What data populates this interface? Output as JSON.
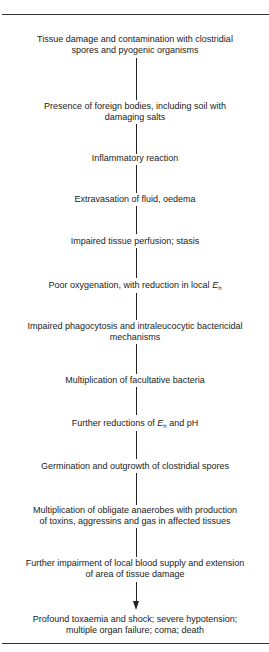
{
  "flowchart": {
    "steps": [
      {
        "lines": [
          "Tissue damage and contamination with clostridial",
          "spores and pyogenic organisms"
        ]
      },
      {
        "lines": [
          "Presence of foreign bodies, including soil with",
          "damaging salts"
        ]
      },
      {
        "lines": [
          "Inflammatory reaction"
        ]
      },
      {
        "lines": [
          "Extravasation of fluid, oedema"
        ]
      },
      {
        "lines": [
          "Impaired tissue perfusion; stasis"
        ]
      },
      {
        "text_before": "Poor oxygenation, with reduction in local ",
        "symbol": "E",
        "subscript": "h",
        "text_after": ""
      },
      {
        "lines": [
          "Impaired phagocytosis and intraleucocytic bactericidal",
          "mechanisms"
        ]
      },
      {
        "lines": [
          "Multiplication of facultative bacteria"
        ]
      },
      {
        "text_before": "Further reductions of ",
        "symbol": "E",
        "subscript": "h",
        "text_after": " and pH"
      },
      {
        "lines": [
          "Germination and outgrowth of clostridial spores"
        ]
      },
      {
        "lines": [
          "Multiplication of obligate anaerobes with production",
          "of toxins, aggressins and gas in affected tissues"
        ]
      },
      {
        "lines": [
          "Further impairment of local blood supply and extension",
          "of area of tissue damage"
        ]
      },
      {
        "lines": [
          "Profound toxaemia and shock; severe hypotension;",
          "multiple organ failure; coma; death"
        ]
      }
    ],
    "final_connector": "arrow-down"
  }
}
